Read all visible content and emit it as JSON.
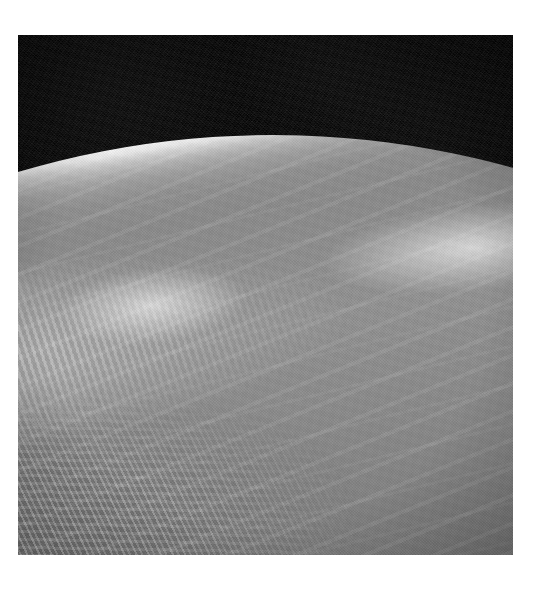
{
  "document": {
    "background_color": "#ffffff",
    "kind": "photograph-plate"
  },
  "photograph": {
    "name": "earth-limb-orbital-photo",
    "medium": "black-and-white orbital photograph",
    "orientation": "looking north-east across the Sinai Peninsula toward the horizon",
    "frame": {
      "left": 18,
      "top": 35,
      "width": 495,
      "height": 520
    },
    "palette": {
      "space_black": "#090909",
      "limb_highlight": "#efefef",
      "atmosphere_gray": "#b0b0b0",
      "land_mid_gray": "#8c8c8c",
      "bright_sand": "#e6e6e6",
      "water_dark": "#101010",
      "paper_white": "#ffffff"
    },
    "features": [
      {
        "id": "space",
        "label": "Black space above the horizon"
      },
      {
        "id": "limb",
        "label": "Bright atmospheric limb along the curved horizon"
      },
      {
        "id": "cloud-band",
        "label": "Mottled cumulus cloud field, upper left"
      },
      {
        "id": "cirrus",
        "label": "Bright cirrus streaks near the horizon"
      },
      {
        "id": "bright-sand",
        "label": "Sunlit sand and haze sheet, centre left"
      },
      {
        "id": "rift-valley",
        "label": "Dark rift valley — Gulf of Aqaba / Dead Sea trough"
      },
      {
        "id": "gulf-of-suez",
        "label": "Gulf of Suez, dark water band at lower left"
      },
      {
        "id": "red-sea",
        "label": "Red Sea, dark water at bottom left corner"
      },
      {
        "id": "sinai-massif",
        "label": "Rugged Sinai mountain ridges"
      },
      {
        "id": "dark-highlands",
        "label": "Dark highland ranges, lower right"
      }
    ]
  }
}
